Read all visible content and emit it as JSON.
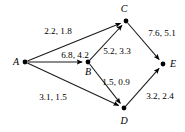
{
  "figure": {
    "type": "directed-graph",
    "background_color": "#ffffff",
    "stroke_color": "#1a1a1a"
  },
  "nodes": [
    {
      "id": "A",
      "label": "A",
      "x": 25,
      "y": 62,
      "label_x": 16,
      "label_y": 65
    },
    {
      "id": "B",
      "label": "B",
      "x": 88,
      "y": 62,
      "label_x": 88,
      "label_y": 75
    },
    {
      "id": "C",
      "label": "C",
      "x": 126,
      "y": 21,
      "label_x": 124,
      "label_y": 12
    },
    {
      "id": "D",
      "label": "D",
      "x": 124,
      "y": 108,
      "label_x": 124,
      "label_y": 124
    },
    {
      "id": "E",
      "label": "E",
      "x": 163,
      "y": 64,
      "label_x": 173,
      "label_y": 67
    }
  ],
  "edges": [
    {
      "id": "A-C",
      "from": "A",
      "to": "C",
      "label": "2.2, 1.8",
      "label_x": 58,
      "label_y": 34,
      "anchor": "middle"
    },
    {
      "id": "A-B",
      "from": "A",
      "to": "B",
      "label": "6.8, 4.2",
      "label_x": 75,
      "label_y": 58,
      "anchor": "middle"
    },
    {
      "id": "A-D",
      "from": "A",
      "to": "D",
      "label": "3.1, 1.5",
      "label_x": 53,
      "label_y": 100,
      "anchor": "middle"
    },
    {
      "id": "B-C",
      "from": "B",
      "to": "C",
      "label": "5.2, 3.3",
      "label_x": 117,
      "label_y": 54,
      "anchor": "middle"
    },
    {
      "id": "B-D",
      "from": "B",
      "to": "D",
      "label": "1.5, 0.9",
      "label_x": 116,
      "label_y": 85,
      "anchor": "middle"
    },
    {
      "id": "C-E",
      "from": "C",
      "to": "E",
      "label": "7.6, 5.1",
      "label_x": 162,
      "label_y": 36,
      "anchor": "middle"
    },
    {
      "id": "D-E",
      "from": "D",
      "to": "E",
      "label": "3.2, 2.4",
      "label_x": 160,
      "label_y": 99,
      "anchor": "middle"
    }
  ]
}
